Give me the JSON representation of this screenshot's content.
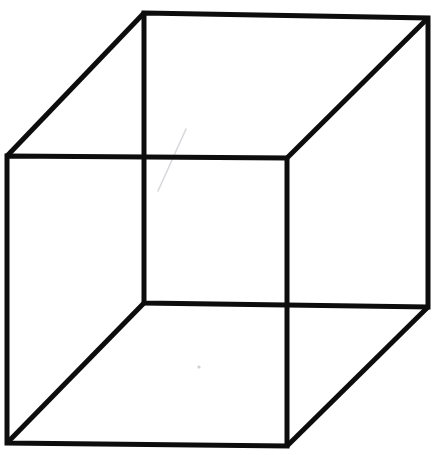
{
  "figure": {
    "type": "line-drawing",
    "canvas": {
      "width": 436,
      "height": 455,
      "background": "#ffffff"
    },
    "stroke": {
      "color": "#0d0d0d",
      "width_px": 5
    },
    "vertices": {
      "front_top_left": [
        7,
        156
      ],
      "front_top_right": [
        287,
        158
      ],
      "front_bottom_right": [
        287,
        446
      ],
      "front_bottom_left": [
        7,
        443
      ],
      "back_top_left": [
        144,
        13
      ],
      "back_top_right": [
        428,
        18
      ],
      "back_bottom_right": [
        428,
        307
      ],
      "back_bottom_left": [
        144,
        303
      ]
    },
    "edges": [
      {
        "name": "front-face-top",
        "from": "front_top_left",
        "to": "front_top_right"
      },
      {
        "name": "front-face-right",
        "from": "front_top_right",
        "to": "front_bottom_right"
      },
      {
        "name": "front-face-bottom",
        "from": "front_bottom_right",
        "to": "front_bottom_left"
      },
      {
        "name": "front-face-left",
        "from": "front_bottom_left",
        "to": "front_top_left"
      },
      {
        "name": "back-face-top",
        "from": "back_top_left",
        "to": "back_top_right"
      },
      {
        "name": "back-face-right",
        "from": "back_top_right",
        "to": "back_bottom_right"
      },
      {
        "name": "back-face-bottom",
        "from": "back_bottom_right",
        "to": "back_bottom_left"
      },
      {
        "name": "back-face-left",
        "from": "back_bottom_left",
        "to": "back_top_left"
      },
      {
        "name": "connector-top-left",
        "from": "front_top_left",
        "to": "back_top_left"
      },
      {
        "name": "connector-top-right",
        "from": "front_top_right",
        "to": "back_top_right"
      },
      {
        "name": "connector-bottom-left",
        "from": "front_bottom_left",
        "to": "back_bottom_left"
      },
      {
        "name": "connector-bottom-right",
        "from": "front_bottom_right",
        "to": "back_bottom_right"
      }
    ],
    "paths": {
      "front_face": "M 7 156 L 287 158 L 287 446 L 7 443 Z",
      "back_face": "M 144 13 L 428 18 L 428 307 L 144 303 Z",
      "connector_top_left": "M 7 156 L 144 13",
      "connector_top_right": "M 287 158 L 428 18",
      "connector_bottom_left": "M 7 443 L 144 303",
      "connector_bottom_right": "M 287 446 L 428 307"
    },
    "artifacts": {
      "scratch_path": "M 186 129 L 158 191",
      "dot_cx": 199,
      "dot_cy": 367,
      "dot_r": 1.6
    }
  }
}
